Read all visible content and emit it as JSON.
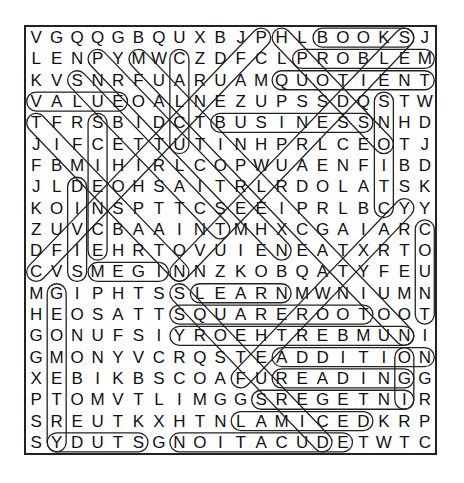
{
  "puzzle": {
    "rows": [
      "VGQQGBQUXBJPHLBOOKSJ",
      "LENPYMWCZDFCLPROBLEM",
      "KVSNRFUARUAMQUOTIENT",
      "VALUEOALNEZUPSSDQSTW",
      "TFRSBIDCTBUSINESSNHD",
      "JIFCETTUTINHPRLCEOTJ",
      "FBMIHIRLCOPWUAENFIBD",
      "JLDEOHSAITRLRDOLATSK",
      "KOINSPTTCSEEIPRLBCYY",
      "ZUVCBAAINTMHXCGAIARC",
      "DFIEHRTOVUIENEATXRTO",
      "CVSMEGINNZKOBQATYFEU",
      "MGIPHTSSLEARNMWNIUMN",
      "HEOSATTSQUAREROOTOOT",
      "GONUFSIYROEHTREBMUNI",
      "GMONYVCRQSTEADDITION",
      "XEBIKBSCOAFUREADINGG",
      "PTOMVTLIMGGSREGETNIR",
      "SREUTKXHTNLAMICEDKRP",
      "SYDUTSGNOITACUDETWTC"
    ],
    "found_words": [
      {
        "word": "BOOKS",
        "r1": 0,
        "c1": 14,
        "r2": 0,
        "c2": 18
      },
      {
        "word": "PROBLEM",
        "r1": 1,
        "c1": 13,
        "r2": 1,
        "c2": 19
      },
      {
        "word": "QUOTIENT",
        "r1": 2,
        "c1": 12,
        "r2": 2,
        "c2": 19
      },
      {
        "word": "VALUE",
        "r1": 3,
        "c1": 0,
        "r2": 3,
        "c2": 4
      },
      {
        "word": "BUSINESS",
        "r1": 4,
        "c1": 9,
        "r2": 4,
        "c2": 16
      },
      {
        "word": "LEARN",
        "r1": 12,
        "c1": 8,
        "r2": 12,
        "c2": 12
      },
      {
        "word": "SQUAREROOT",
        "r1": 13,
        "c1": 7,
        "r2": 13,
        "c2": 16
      },
      {
        "word": "NUMBERTHEORY",
        "r1": 14,
        "c1": 18,
        "r2": 14,
        "c2": 7
      },
      {
        "word": "ADDITION",
        "r1": 15,
        "c1": 12,
        "r2": 15,
        "c2": 19
      },
      {
        "word": "READING",
        "r1": 16,
        "c1": 12,
        "r2": 16,
        "c2": 18
      },
      {
        "word": "INTEGERS",
        "r1": 17,
        "c1": 18,
        "r2": 17,
        "c2": 11
      },
      {
        "word": "DECIMAL",
        "r1": 18,
        "c1": 16,
        "r2": 18,
        "c2": 10
      },
      {
        "word": "EDUCATION",
        "r1": 19,
        "c1": 15,
        "r2": 19,
        "c2": 7
      },
      {
        "word": "STUDY",
        "r1": 19,
        "c1": 5,
        "r2": 19,
        "c2": 1
      },
      {
        "word": "COUNT",
        "r1": 9,
        "c1": 19,
        "r2": 13,
        "c2": 19
      },
      {
        "word": "STORY",
        "r1": 3,
        "c1": 17,
        "r2": 8,
        "c2": 17
      },
      {
        "word": "CUT",
        "r1": 1,
        "c1": 7,
        "r2": 5,
        "c2": 7
      },
      {
        "word": "SCIENCE",
        "r1": 4,
        "c1": 3,
        "r2": 10,
        "c2": 3
      },
      {
        "word": "DIVIDE",
        "r1": 7,
        "c1": 2,
        "r2": 11,
        "c2": 2
      },
      {
        "word": "GEOMETRY",
        "r1": 12,
        "c1": 1,
        "r2": 19,
        "c2": 1
      },
      {
        "word": "MEGS",
        "r1": 11,
        "c1": 3,
        "r2": 11,
        "c2": 6
      },
      {
        "word": "TERM",
        "r1": 17,
        "c1": 18,
        "r2": 15,
        "c2": 18
      },
      {
        "word": "DIAG-A",
        "r1": 0,
        "c1": 11,
        "r2": 11,
        "c2": 0
      },
      {
        "word": "DIAG-B",
        "r1": 0,
        "c1": 12,
        "r2": 5,
        "c2": 17
      },
      {
        "word": "DIAG-C",
        "r1": 1,
        "c1": 3,
        "r2": 10,
        "c2": 12
      },
      {
        "word": "DIAG-D",
        "r1": 1,
        "c1": 5,
        "r2": 14,
        "c2": 18
      },
      {
        "word": "DIAG-E",
        "r1": 2,
        "c1": 2,
        "r2": 9,
        "c2": 9
      },
      {
        "word": "DIAG-F",
        "r1": 0,
        "c1": 18,
        "r2": 11,
        "c2": 7
      },
      {
        "word": "DIAG-G",
        "r1": 4,
        "c1": 0,
        "r2": 11,
        "c2": 7
      },
      {
        "word": "DIAG-H",
        "r1": 8,
        "c1": 18,
        "r2": 16,
        "c2": 10
      },
      {
        "word": "DIAG-I",
        "r1": 12,
        "c1": 7,
        "r2": 19,
        "c2": 14
      }
    ]
  }
}
